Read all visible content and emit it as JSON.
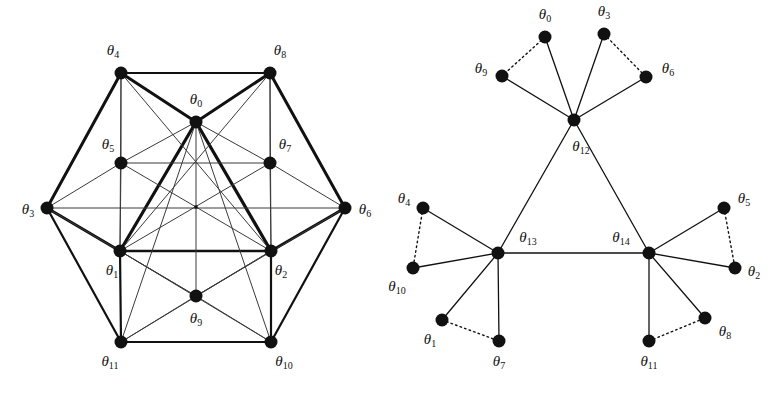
{
  "figure": {
    "background_color": "#ffffff",
    "ink_color": "#111111",
    "caption": ""
  },
  "panels": [
    {
      "id": "left-graph",
      "name": "hexagonal-graph",
      "node_radius": 6.5,
      "center_marker": {
        "x": 196,
        "y": 207,
        "size": 3.2
      },
      "nodes": [
        {
          "id": "t0",
          "label": "θ",
          "sub": "0",
          "x": 196,
          "y": 122,
          "label_x": 196,
          "label_y": 101,
          "anchor": "middle"
        },
        {
          "id": "t1",
          "label": "θ",
          "sub": "1",
          "x": 120,
          "y": 251,
          "label_x": 112,
          "label_y": 272,
          "anchor": "middle"
        },
        {
          "id": "t2",
          "label": "θ",
          "sub": "2",
          "x": 271,
          "y": 251,
          "label_x": 281,
          "label_y": 272,
          "anchor": "middle"
        },
        {
          "id": "t3",
          "label": "θ",
          "sub": "3",
          "x": 47,
          "y": 208,
          "label_x": 28,
          "label_y": 211,
          "anchor": "middle"
        },
        {
          "id": "t4",
          "label": "θ",
          "sub": "4",
          "x": 121,
          "y": 73,
          "label_x": 113,
          "label_y": 52,
          "anchor": "middle"
        },
        {
          "id": "t5",
          "label": "θ",
          "sub": "5",
          "x": 121,
          "y": 163,
          "label_x": 108,
          "label_y": 146,
          "anchor": "middle"
        },
        {
          "id": "t6",
          "label": "θ",
          "sub": "6",
          "x": 345,
          "y": 208,
          "label_x": 365,
          "label_y": 211,
          "anchor": "middle"
        },
        {
          "id": "t7",
          "label": "θ",
          "sub": "7",
          "x": 270,
          "y": 163,
          "label_x": 285,
          "label_y": 146,
          "anchor": "middle"
        },
        {
          "id": "t8",
          "label": "θ",
          "sub": "8",
          "x": 270,
          "y": 73,
          "label_x": 280,
          "label_y": 52,
          "anchor": "middle"
        },
        {
          "id": "t9",
          "label": "θ",
          "sub": "9",
          "x": 196,
          "y": 296,
          "label_x": 196,
          "label_y": 320,
          "anchor": "middle"
        },
        {
          "id": "t10",
          "label": "θ",
          "sub": "10",
          "x": 271,
          "y": 342,
          "label_x": 284,
          "label_y": 363,
          "anchor": "middle"
        },
        {
          "id": "t11",
          "label": "θ",
          "sub": "11",
          "x": 121,
          "y": 342,
          "label_x": 110,
          "label_y": 363,
          "anchor": "middle"
        }
      ],
      "edges": [
        {
          "a": "t4",
          "b": "t8",
          "w": 2.0
        },
        {
          "a": "t4",
          "b": "t3",
          "w": 3.0
        },
        {
          "a": "t8",
          "b": "t6",
          "w": 3.0
        },
        {
          "a": "t3",
          "b": "t11",
          "w": 2.2
        },
        {
          "a": "t6",
          "b": "t10",
          "w": 2.2
        },
        {
          "a": "t11",
          "b": "t10",
          "w": 2.0
        },
        {
          "a": "t4",
          "b": "t0",
          "w": 3.0
        },
        {
          "a": "t0",
          "b": "t8",
          "w": 3.0
        },
        {
          "a": "t3",
          "b": "t1",
          "w": 3.0
        },
        {
          "a": "t2",
          "b": "t6",
          "w": 3.0
        },
        {
          "a": "t0",
          "b": "t1",
          "w": 3.2
        },
        {
          "a": "t0",
          "b": "t2",
          "w": 3.2
        },
        {
          "a": "t1",
          "b": "t2",
          "w": 2.4
        },
        {
          "a": "t1",
          "b": "t11",
          "w": 2.2
        },
        {
          "a": "t2",
          "b": "t10",
          "w": 2.2
        },
        {
          "a": "t1",
          "b": "t10",
          "w": 1.0
        },
        {
          "a": "t2",
          "b": "t11",
          "w": 1.0
        },
        {
          "a": "t11",
          "b": "t9",
          "w": 1.0
        },
        {
          "a": "t10",
          "b": "t9",
          "w": 1.0
        },
        {
          "a": "t1",
          "b": "t9",
          "w": 1.0
        },
        {
          "a": "t2",
          "b": "t9",
          "w": 1.0
        },
        {
          "a": "t0",
          "b": "t9",
          "w": 1.0
        },
        {
          "a": "t4",
          "b": "t5",
          "w": 1.0
        },
        {
          "a": "t8",
          "b": "t7",
          "w": 1.0
        },
        {
          "a": "t5",
          "b": "t7",
          "w": 1.0
        },
        {
          "a": "t3",
          "b": "t5",
          "w": 1.0
        },
        {
          "a": "t3",
          "b": "t6",
          "w": 1.0
        },
        {
          "a": "t6",
          "b": "t7",
          "w": 1.0
        },
        {
          "a": "t5",
          "b": "t1",
          "w": 1.0
        },
        {
          "a": "t7",
          "b": "t2",
          "w": 1.0
        },
        {
          "a": "t5",
          "b": "t2",
          "w": 1.0
        },
        {
          "a": "t7",
          "b": "t1",
          "w": 1.0
        },
        {
          "a": "t4",
          "b": "t1",
          "w": 1.0
        },
        {
          "a": "t8",
          "b": "t2",
          "w": 1.0
        },
        {
          "a": "t4",
          "b": "t2",
          "w": 1.0
        },
        {
          "a": "t8",
          "b": "t1",
          "w": 1.0
        },
        {
          "a": "t0",
          "b": "t5",
          "w": 1.0
        },
        {
          "a": "t0",
          "b": "t7",
          "w": 1.0
        },
        {
          "a": "t0",
          "b": "t11",
          "w": 1.0
        },
        {
          "a": "t0",
          "b": "t10",
          "w": 1.0
        },
        {
          "a": "t3",
          "b": "t9",
          "w": 1.0
        },
        {
          "a": "t6",
          "b": "t9",
          "w": 1.0
        }
      ]
    },
    {
      "id": "right-graph",
      "name": "tree-graph",
      "node_radius": 6.5,
      "nodes": [
        {
          "id": "t0",
          "label": "θ",
          "sub": "0",
          "x": 160,
          "y": 37,
          "label_x": 160,
          "label_y": 16,
          "anchor": "middle"
        },
        {
          "id": "t3",
          "label": "θ",
          "sub": "3",
          "x": 219,
          "y": 34,
          "label_x": 219,
          "label_y": 13,
          "anchor": "middle"
        },
        {
          "id": "t9",
          "label": "θ",
          "sub": "9",
          "x": 117,
          "y": 76,
          "label_x": 96,
          "label_y": 70,
          "anchor": "middle"
        },
        {
          "id": "t6",
          "label": "θ",
          "sub": "6",
          "x": 261,
          "y": 77,
          "label_x": 283,
          "label_y": 70,
          "anchor": "middle"
        },
        {
          "id": "t12",
          "label": "θ",
          "sub": "12",
          "x": 189,
          "y": 120,
          "label_x": 196,
          "label_y": 148,
          "anchor": "middle"
        },
        {
          "id": "t13",
          "label": "θ",
          "sub": "13",
          "x": 113,
          "y": 253,
          "label_x": 143,
          "label_y": 239,
          "anchor": "middle"
        },
        {
          "id": "t14",
          "label": "θ",
          "sub": "14",
          "x": 264,
          "y": 253,
          "label_x": 236,
          "label_y": 239,
          "anchor": "middle"
        },
        {
          "id": "t4",
          "label": "θ",
          "sub": "4",
          "x": 38,
          "y": 208,
          "label_x": 19,
          "label_y": 200,
          "anchor": "middle"
        },
        {
          "id": "t10",
          "label": "θ",
          "sub": "10",
          "x": 28,
          "y": 268,
          "label_x": 12,
          "label_y": 288,
          "anchor": "middle"
        },
        {
          "id": "t1",
          "label": "θ",
          "sub": "1",
          "x": 57,
          "y": 320,
          "label_x": 45,
          "label_y": 341,
          "anchor": "middle"
        },
        {
          "id": "t7",
          "label": "θ",
          "sub": "7",
          "x": 114,
          "y": 341,
          "label_x": 114,
          "label_y": 363,
          "anchor": "middle"
        },
        {
          "id": "t5",
          "label": "θ",
          "sub": "5",
          "x": 339,
          "y": 208,
          "label_x": 359,
          "label_y": 200,
          "anchor": "middle"
        },
        {
          "id": "t2",
          "label": "θ",
          "sub": "2",
          "x": 350,
          "y": 268,
          "label_x": 369,
          "label_y": 273,
          "anchor": "middle"
        },
        {
          "id": "t8",
          "label": "θ",
          "sub": "8",
          "x": 320,
          "y": 318,
          "label_x": 340,
          "label_y": 333,
          "anchor": "middle"
        },
        {
          "id": "t11",
          "label": "θ",
          "sub": "11",
          "x": 264,
          "y": 341,
          "label_x": 264,
          "label_y": 363,
          "anchor": "middle"
        }
      ],
      "edges": [
        {
          "a": "t12",
          "b": "t0",
          "style": "solid"
        },
        {
          "a": "t12",
          "b": "t3",
          "style": "solid"
        },
        {
          "a": "t12",
          "b": "t9",
          "style": "solid"
        },
        {
          "a": "t12",
          "b": "t6",
          "style": "solid"
        },
        {
          "a": "t0",
          "b": "t9",
          "style": "dotted"
        },
        {
          "a": "t3",
          "b": "t6",
          "style": "dotted"
        },
        {
          "a": "t12",
          "b": "t13",
          "style": "solid"
        },
        {
          "a": "t12",
          "b": "t14",
          "style": "solid"
        },
        {
          "a": "t13",
          "b": "t14",
          "style": "solid"
        },
        {
          "a": "t13",
          "b": "t4",
          "style": "solid"
        },
        {
          "a": "t13",
          "b": "t10",
          "style": "solid"
        },
        {
          "a": "t4",
          "b": "t10",
          "style": "dotted"
        },
        {
          "a": "t13",
          "b": "t1",
          "style": "solid"
        },
        {
          "a": "t13",
          "b": "t7",
          "style": "solid"
        },
        {
          "a": "t1",
          "b": "t7",
          "style": "dotted"
        },
        {
          "a": "t14",
          "b": "t5",
          "style": "solid"
        },
        {
          "a": "t14",
          "b": "t2",
          "style": "solid"
        },
        {
          "a": "t5",
          "b": "t2",
          "style": "dotted"
        },
        {
          "a": "t14",
          "b": "t8",
          "style": "solid"
        },
        {
          "a": "t14",
          "b": "t11",
          "style": "solid"
        },
        {
          "a": "t11",
          "b": "t8",
          "style": "dotted"
        }
      ]
    }
  ]
}
